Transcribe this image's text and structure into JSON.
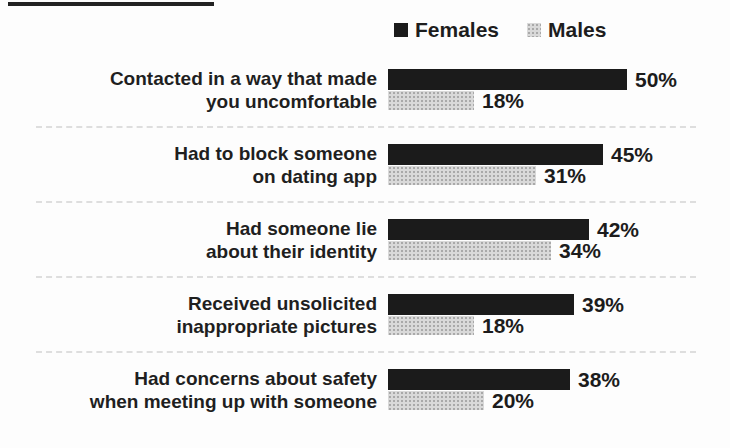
{
  "legend": {
    "items": [
      {
        "label": "Females",
        "color": "#1b1b1b"
      },
      {
        "label": "Males",
        "color": "#d9d9d9"
      }
    ]
  },
  "chart_data": {
    "type": "bar",
    "orientation": "horizontal",
    "title": "",
    "categories": [
      "Contacted in a way that made you uncomfortable",
      "Had to block someone on dating app",
      "Had someone lie about their identity",
      "Received unsolicited inappropriate pictures",
      "Had concerns about safety when meeting up with someone"
    ],
    "series": [
      {
        "name": "Females",
        "values": [
          50,
          45,
          42,
          39,
          38
        ],
        "color": "#1b1b1b"
      },
      {
        "name": "Males",
        "values": [
          18,
          31,
          34,
          18,
          20
        ],
        "color": "#d9d9d9"
      }
    ],
    "unit": "%",
    "value_labels": true,
    "xlim": [
      0,
      52
    ],
    "grid": false,
    "legend_position": "top"
  },
  "rows": [
    {
      "label_lines": [
        "Contacted in a way that made",
        "you uncomfortable"
      ],
      "female_label": "50%",
      "male_label": "18%"
    },
    {
      "label_lines": [
        "Had to block someone",
        "on dating app"
      ],
      "female_label": "45%",
      "male_label": "31%"
    },
    {
      "label_lines": [
        "Had someone lie",
        "about their identity"
      ],
      "female_label": "42%",
      "male_label": "34%"
    },
    {
      "label_lines": [
        "Received unsolicited",
        "inappropriate pictures"
      ],
      "female_label": "39%",
      "male_label": "18%"
    },
    {
      "label_lines": [
        "Had concerns about safety",
        "when meeting up with someone"
      ],
      "female_label": "38%",
      "male_label": "20%"
    }
  ]
}
